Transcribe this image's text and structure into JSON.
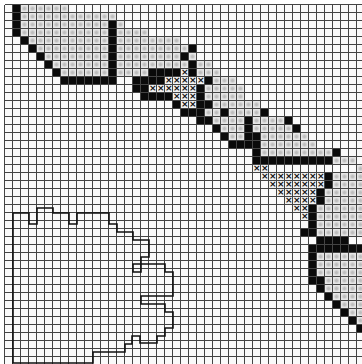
{
  "chart_data": {
    "type": "table",
    "title": "",
    "grid": {
      "cols": 45,
      "rows": 45,
      "cell_px": 8
    },
    "legend": {
      ".": "empty",
      "#": "solid black stitch",
      "o": "gray dotted stitch",
      "x": "cross stitch"
    },
    "rows": [
      ".#oooooo.....................................",
      ".#oooooooooooo...............................",
      ".#ooooooooooo#o..............................",
      ".#ooooooooooo#oooo...........................",
      "..#oooooooooo#oooooooo.......................",
      "...#ooooooooo#ooooooooo#.....................",
      "....#oooooooo#oooooooo#o.....................",
      ".....#ooooooo#ooooooooo#oo...................",
      "......#oooooo#oooo####x#ooo..................",
      ".......#######..####xxxxx#ooo................",
      "................##xxxxxx#ooooo...............",
      ".................####xxx#ooooo...............",
      ".....................#xx##oooooo.............",
      "......................###oo#oooo#............",
      "........................##oooo#oooo#.........",
      "..........................#ooo#ooooo#........",
      "...........................#oo##oooooo.......",
      "............................####ooooooo......",
      "...............................#ooooooooo#...",
      "...............................##########ooo.",
      "...............................xx...........o",
      "................................xxxxxxxx#ooooo",
      ".................................xxxxxxx#oooo",
      "..................................xxxxx#ooooo",
      "...................................xxxx#ooooo",
      "....................................xx#oooooo",
      ".....................................x#oooooo",
      "......................................#oooooo",
      ".....................................##oooooo",
      ".......................................####..",
      "......................................#######",
      "......................................#oooooo",
      "......................................#oooooo",
      "......................................#oooooo",
      "......................................##ooooo",
      ".......................................#ooooo",
      "........................................#oooo",
      ".........................................#ooo",
      "..........................................#oo",
      "...........................................#o",
      "............................................#",
      ".............................................",
      ".............................................",
      ".............................................",
      "............................................."
    ],
    "outline_shape": "hand-drawn irregular closed outline in lower-left region (x≈13–172px, y≈204–358px)"
  }
}
